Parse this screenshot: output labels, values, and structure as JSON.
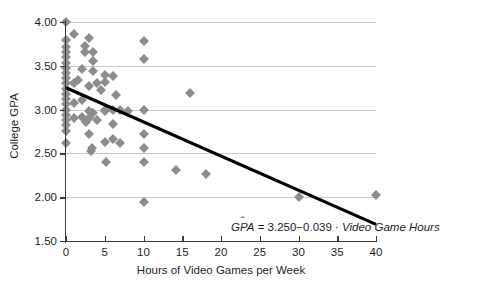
{
  "chart_data": {
    "type": "scatter",
    "title": "",
    "xlabel": "Hours of Video Games per Week",
    "ylabel": "College GPA",
    "xlim": [
      0,
      40
    ],
    "ylim": [
      1.5,
      4.0
    ],
    "xticks": [
      0,
      5,
      10,
      15,
      20,
      25,
      30,
      35,
      40
    ],
    "xticklabels": [
      "0",
      "5",
      "10",
      "15",
      "20",
      "25",
      "30",
      "35",
      "40"
    ],
    "yticks": [
      1.5,
      2.0,
      2.5,
      3.0,
      3.5,
      4.0
    ],
    "yticklabels": [
      "1.50",
      "2.00",
      "2.50",
      "3.00",
      "3.50",
      "4.00"
    ],
    "grid": "horizontal",
    "legend": "none",
    "marker": "diamond",
    "marker_color": "#8d8d8d",
    "line_color": "#000000",
    "grid_color": "#c9c9c9",
    "axis_color": "#3b3b3b",
    "annotation": {
      "text_response": "GPA",
      "hat": "̂",
      "equals": " = ",
      "intercept": "3.250",
      "minus": "−",
      "slope": "0.039",
      "dot": " · ",
      "predictor": "Video Game Hours",
      "full_text": "GPÂ = 3.250 − 0.039 · Video Game Hours"
    },
    "fit_line": {
      "intercept": 3.25,
      "slope": -0.039,
      "x_start": 0,
      "x_end": 40,
      "y_start": 3.25,
      "y_end": 1.69
    },
    "points": [
      [
        0.0,
        4.0
      ],
      [
        0.0,
        3.8
      ],
      [
        0.0,
        3.72
      ],
      [
        0.0,
        3.66
      ],
      [
        0.0,
        3.6
      ],
      [
        0.0,
        3.53
      ],
      [
        0.0,
        3.47
      ],
      [
        0.0,
        3.42
      ],
      [
        0.0,
        3.36
      ],
      [
        0.0,
        3.3
      ],
      [
        0.0,
        3.24
      ],
      [
        0.0,
        3.18
      ],
      [
        0.0,
        3.12
      ],
      [
        0.0,
        3.06
      ],
      [
        0.0,
        3.0
      ],
      [
        0.0,
        2.94
      ],
      [
        0.0,
        2.88
      ],
      [
        0.0,
        2.82
      ],
      [
        0.0,
        2.76
      ],
      [
        0.0,
        2.62
      ],
      [
        1.0,
        3.86
      ],
      [
        1.0,
        3.3
      ],
      [
        1.0,
        3.08
      ],
      [
        1.0,
        2.9
      ],
      [
        1.5,
        3.34
      ],
      [
        2.0,
        3.46
      ],
      [
        2.0,
        3.11
      ],
      [
        2.0,
        2.92
      ],
      [
        2.5,
        3.73
      ],
      [
        2.5,
        3.66
      ],
      [
        2.6,
        2.86
      ],
      [
        3.0,
        3.82
      ],
      [
        3.0,
        3.27
      ],
      [
        3.0,
        2.98
      ],
      [
        3.0,
        2.9
      ],
      [
        3.0,
        2.72
      ],
      [
        3.2,
        2.53
      ],
      [
        3.3,
        2.56
      ],
      [
        3.5,
        3.66
      ],
      [
        3.5,
        3.56
      ],
      [
        3.5,
        3.44
      ],
      [
        3.5,
        2.96
      ],
      [
        4.0,
        3.3
      ],
      [
        4.0,
        2.88
      ],
      [
        4.5,
        3.22
      ],
      [
        5.0,
        3.4
      ],
      [
        5.0,
        3.31
      ],
      [
        5.0,
        3.0
      ],
      [
        5.0,
        2.98
      ],
      [
        5.0,
        2.63
      ],
      [
        5.2,
        2.4
      ],
      [
        6.0,
        3.38
      ],
      [
        6.0,
        3.0
      ],
      [
        6.0,
        2.84
      ],
      [
        6.0,
        2.67
      ],
      [
        6.5,
        3.17
      ],
      [
        7.0,
        2.99
      ],
      [
        7.0,
        2.62
      ],
      [
        8.0,
        2.98
      ],
      [
        10.0,
        3.78
      ],
      [
        10.0,
        3.58
      ],
      [
        10.0,
        3.0
      ],
      [
        10.0,
        2.72
      ],
      [
        10.0,
        2.56
      ],
      [
        10.0,
        2.4
      ],
      [
        10.0,
        1.94
      ],
      [
        14.2,
        2.31
      ],
      [
        16.0,
        3.19
      ],
      [
        18.0,
        2.27
      ],
      [
        30.0,
        2.0
      ],
      [
        40.0,
        2.02
      ]
    ]
  }
}
